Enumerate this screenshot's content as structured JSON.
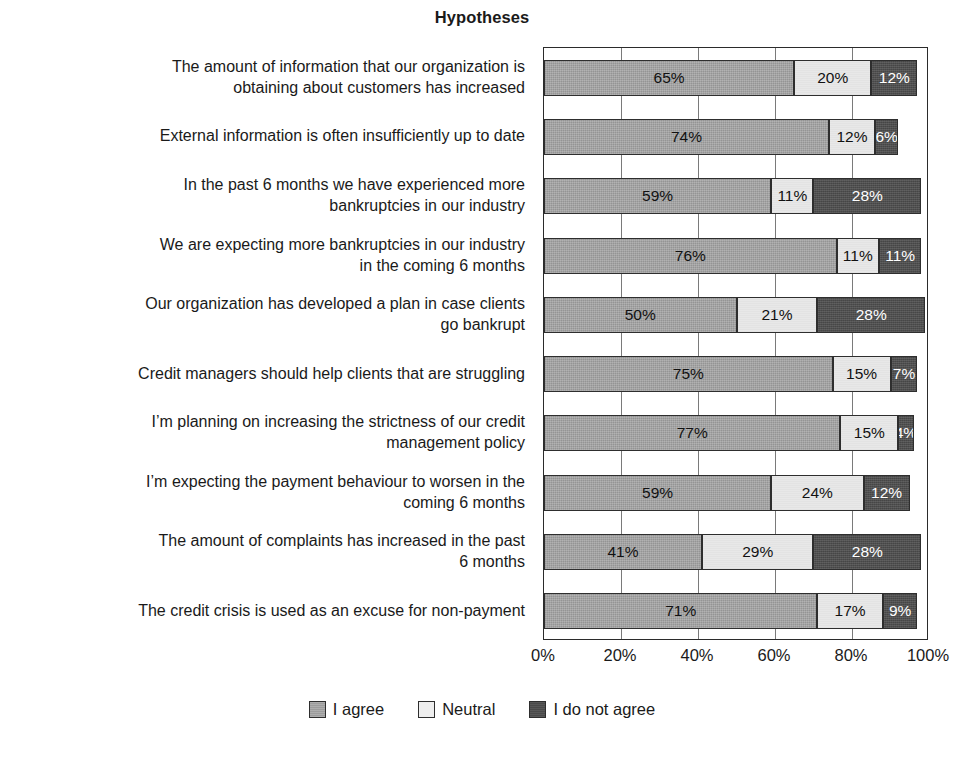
{
  "chart_data": {
    "type": "bar",
    "orientation": "horizontal",
    "stacked": true,
    "title": "Hypotheses",
    "xlabel": "",
    "ylabel": "",
    "xlim": [
      0,
      100
    ],
    "grid": true,
    "legend_position": "bottom",
    "xticks": [
      "0%",
      "20%",
      "40%",
      "60%",
      "80%",
      "100%"
    ],
    "xtick_values": [
      0,
      20,
      40,
      60,
      80,
      100
    ],
    "categories": [
      "The amount of information that our organization is obtaining about customers has increased",
      "External information is often insufficiently up to date",
      "In the past 6 months we have experienced more bankruptcies in our industry",
      "We are expecting more bankruptcies in our industry in the coming 6 months",
      "Our organization has developed a plan in case clients go bankrupt",
      "Credit managers should help clients that are struggling",
      "I’m planning on increasing the strictness of our credit management policy",
      "I’m expecting the payment behaviour to worsen in the coming 6 months",
      "The amount of complaints has increased in the past 6 months",
      "The credit crisis is used as an excuse for non-payment"
    ],
    "series": [
      {
        "name": "I agree",
        "color": "#9c9c9c",
        "values": [
          65,
          74,
          59,
          76,
          50,
          75,
          77,
          59,
          41,
          71
        ]
      },
      {
        "name": "Neutral",
        "color": "#e8e8e8",
        "values": [
          20,
          12,
          11,
          11,
          21,
          15,
          15,
          24,
          29,
          17
        ]
      },
      {
        "name": "I do not agree",
        "color": "#4a4a4a",
        "values": [
          12,
          6,
          28,
          11,
          28,
          7,
          4,
          12,
          28,
          9
        ]
      }
    ],
    "data_labels": [
      [
        "65%",
        "20%",
        "12%"
      ],
      [
        "74%",
        "12%",
        "6%"
      ],
      [
        "59%",
        "11%",
        "28%"
      ],
      [
        "76%",
        "11%",
        "11%"
      ],
      [
        "50%",
        "21%",
        "28%"
      ],
      [
        "75%",
        "15%",
        "7%"
      ],
      [
        "77%",
        "15%",
        "4%"
      ],
      [
        "59%",
        "24%",
        "12%"
      ],
      [
        "41%",
        "29%",
        "28%"
      ],
      [
        "71%",
        "17%",
        "9%"
      ]
    ]
  },
  "category_lines": [
    [
      "The amount of information that our organization is",
      "obtaining about customers has increased"
    ],
    [
      "External information is often insufficiently up to date"
    ],
    [
      "In the past 6 months we have experienced more",
      "bankruptcies in our industry"
    ],
    [
      "We are expecting more bankruptcies in our industry",
      "in the coming 6 months"
    ],
    [
      "Our organization has developed a plan in case clients",
      "go bankrupt"
    ],
    [
      "Credit managers should help clients that are struggling"
    ],
    [
      "I’m planning on increasing the strictness of our credit",
      "management policy"
    ],
    [
      "I’m expecting the payment behaviour to worsen in the",
      "coming 6 months"
    ],
    [
      "The amount of complaints has increased in the past",
      "6 months"
    ],
    [
      "The credit crisis is used as an excuse for non-payment"
    ]
  ],
  "legend": {
    "items": [
      {
        "label": "I agree"
      },
      {
        "label": "Neutral"
      },
      {
        "label": "I do not agree"
      }
    ]
  }
}
